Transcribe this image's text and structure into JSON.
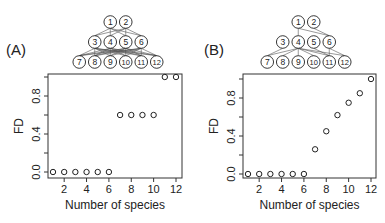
{
  "chart_data": [
    {
      "type": "scatter",
      "panel_label": "(A)",
      "title": "",
      "xlabel": "Number of species",
      "ylabel": "FD",
      "x": [
        1,
        2,
        3,
        4,
        5,
        6,
        7,
        8,
        9,
        10,
        11,
        12
      ],
      "values": [
        0,
        0,
        0,
        0,
        0,
        0,
        0.6,
        0.6,
        0.6,
        0.6,
        1.0,
        1.0
      ],
      "xticks": [
        "2",
        "4",
        "6",
        "8",
        "10",
        "12"
      ],
      "yticks": [
        "0.0",
        "0.4",
        "0.8"
      ],
      "xlim": [
        0.6,
        12.4
      ],
      "ylim": [
        -0.03,
        1.03
      ],
      "grid": false,
      "legend": null,
      "diagram": {
        "levels": [
          [
            "1",
            "2"
          ],
          [
            "3",
            "4",
            "5",
            "6"
          ],
          [
            "7",
            "8",
            "9",
            "10",
            "11",
            "12"
          ]
        ],
        "description": "Densely connected food-web / trophic network"
      }
    },
    {
      "type": "scatter",
      "panel_label": "(B)",
      "title": "",
      "xlabel": "Number of species",
      "ylabel": "FD",
      "x": [
        1,
        2,
        3,
        4,
        5,
        6,
        7,
        8,
        9,
        10,
        11,
        12
      ],
      "values": [
        0,
        0,
        0,
        0,
        0,
        0,
        0.26,
        0.45,
        0.62,
        0.75,
        0.85,
        1.0
      ],
      "xticks": [
        "2",
        "4",
        "6",
        "8",
        "10",
        "12"
      ],
      "yticks": [
        "0.0",
        "0.4",
        "0.8"
      ],
      "xlim": [
        0.6,
        12.4
      ],
      "ylim": [
        -0.03,
        1.03
      ],
      "grid": false,
      "legend": null,
      "diagram": {
        "levels": [
          [
            "1",
            "2"
          ],
          [
            "3",
            "4",
            "5",
            "6"
          ],
          [
            "7",
            "8",
            "9",
            "10",
            "11",
            "12"
          ]
        ],
        "description": "Sparsely connected food-web / trophic network"
      }
    }
  ],
  "panels": {
    "a": {
      "label": "(A)",
      "xlabel": "Number of species",
      "ylabel": "FD"
    },
    "b": {
      "label": "(B)",
      "xlabel": "Number of species",
      "ylabel": "FD"
    }
  }
}
